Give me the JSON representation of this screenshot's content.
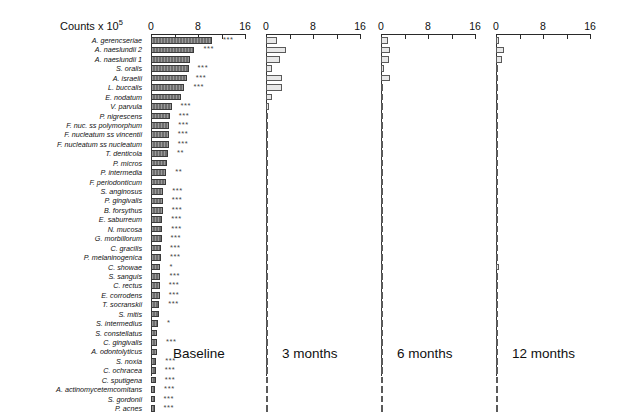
{
  "figure": {
    "axis_title": "Counts x 10",
    "axis_title_exponent": "5",
    "bar_color_baseline": "#6e6e6e",
    "bar_color_followup": "#e8e8e8",
    "axis_color": "#2a2a2a"
  },
  "chart_data": {
    "type": "bar",
    "xlabel": "Counts x 10^5",
    "ylabel": "",
    "xlim": [
      0,
      16
    ],
    "xticks": [
      0,
      4,
      8,
      12,
      16
    ],
    "xticklabels": [
      "0",
      "8",
      "16"
    ],
    "grid": false,
    "legend_position": "none",
    "orientation": "horizontal",
    "categories": [
      "A. gerencseriae",
      "A. naeslundii 2",
      "A. naeslundii 1",
      "S. oralis",
      "A. israelii",
      "L. buccalis",
      "E. nodatum",
      "V. parvula",
      "P. nigrescens",
      "F. nuc. ss polymorphum",
      "F. nucleatum ss vincentii",
      "F. nucleatum ss nucleatum",
      "T. denticola",
      "P. micros",
      "P. intermedia",
      "F. periodonticum",
      "S. anginosus",
      "P. gingivalis",
      "B. forsythus",
      "E. saburreum",
      "N. mucosa",
      "G. morbillorum",
      "C. gracilis",
      "P. melaninogenica",
      "C. showae",
      "S. sanguis",
      "C. rectus",
      "E. corrodens",
      "T. socranskii",
      "S. mitis",
      "S. intermedius",
      "S. constellatus",
      "C. gingivalis",
      "A. odontolyticus",
      "S. noxia",
      "C. ochracea",
      "C. sputigena",
      "A. actinomycetemcomitans",
      "S. gordonii",
      "P. acnes"
    ],
    "panels": [
      {
        "label": "Baseline",
        "values": [
          10.3,
          7.4,
          6.6,
          6.4,
          6.1,
          5.7,
          5.1,
          3.5,
          3.2,
          3.1,
          3.0,
          3.0,
          2.9,
          2.8,
          2.6,
          2.5,
          2.1,
          2.0,
          2.0,
          1.9,
          1.9,
          1.8,
          1.7,
          1.7,
          1.6,
          1.6,
          1.5,
          1.5,
          1.4,
          1.4,
          1.2,
          1.1,
          1.0,
          1.0,
          0.9,
          0.8,
          0.8,
          0.7,
          0.6,
          0.6
        ],
        "significance": [
          "***",
          "***",
          "",
          "***",
          "***",
          "***",
          "",
          "***",
          "***",
          "***",
          "***",
          "***",
          "**",
          "",
          "**",
          "",
          "***",
          "***",
          "***",
          "***",
          "***",
          "***",
          "***",
          "***",
          "*",
          "***",
          "***",
          "***",
          "***",
          "",
          "*",
          "",
          "***",
          "",
          "***",
          "***",
          "***",
          "***",
          "***",
          "***"
        ]
      },
      {
        "label": "3 months",
        "values": [
          1.9,
          3.4,
          2.3,
          1.1,
          2.7,
          2.8,
          1.0,
          0.55,
          0.3,
          0.28,
          0.28,
          0.26,
          0.24,
          0.3,
          0.26,
          0.24,
          0.22,
          0.2,
          0.22,
          0.22,
          0.2,
          0.2,
          0.22,
          0.22,
          0.2,
          0.22,
          0.2,
          0.2,
          0.18,
          0.18,
          0.16,
          0.16,
          0.14,
          0.3,
          0.14,
          0.12,
          0.12,
          0.1,
          0.1,
          0.26
        ],
        "significance": []
      },
      {
        "label": "6 months",
        "values": [
          1.2,
          1.6,
          1.3,
          0.55,
          1.5,
          0.4,
          0.26,
          0.26,
          0.22,
          0.22,
          0.22,
          0.2,
          0.2,
          0.22,
          0.22,
          0.2,
          0.2,
          0.18,
          0.18,
          0.18,
          0.18,
          0.16,
          0.16,
          0.16,
          0.16,
          0.16,
          0.16,
          0.16,
          0.14,
          0.14,
          0.14,
          0.14,
          0.12,
          0.3,
          0.12,
          0.12,
          0.1,
          0.1,
          0.1,
          0.12
        ],
        "significance": []
      },
      {
        "label": "12 months",
        "values": [
          0.55,
          1.3,
          1.1,
          0.3,
          0.26,
          0.24,
          0.24,
          0.22,
          0.22,
          0.22,
          0.22,
          0.2,
          0.2,
          0.2,
          0.18,
          0.18,
          0.18,
          0.18,
          0.16,
          0.16,
          0.16,
          0.16,
          0.16,
          0.16,
          0.55,
          0.16,
          0.16,
          0.14,
          0.14,
          0.14,
          0.14,
          0.12,
          0.12,
          0.3,
          0.12,
          0.12,
          0.1,
          0.1,
          0.1,
          0.1
        ],
        "significance": []
      }
    ]
  }
}
